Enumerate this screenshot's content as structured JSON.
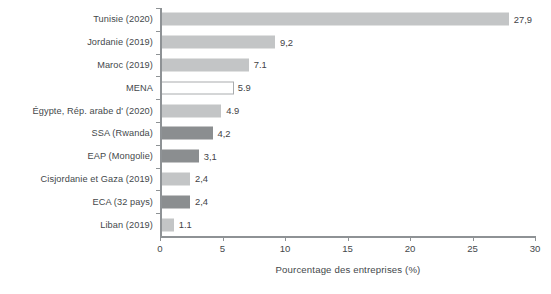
{
  "chart_data": {
    "type": "bar",
    "orientation": "horizontal",
    "title": "",
    "xlabel": "Pourcentage des entreprises (%)",
    "ylabel": "",
    "xlim": [
      0,
      30
    ],
    "xticks": [
      "0",
      "5",
      "10",
      "15",
      "20",
      "25",
      "30"
    ],
    "xtick_values": [
      0,
      5,
      10,
      15,
      20,
      25,
      30
    ],
    "grid": false,
    "legend": "none",
    "decimal_separator": ",",
    "categories": [
      "Tunisie (2020)",
      "Jordanie (2019)",
      "Maroc (2019)",
      "MENA",
      "Égypte, Rép. arabe d' (2020)",
      "SSA (Rwanda)",
      "EAP (Mongolie)",
      "Cisjordanie et Gaza (2019)",
      "ECA (32 pays)",
      "Liban (2019)"
    ],
    "values": [
      27.9,
      9.2,
      7.1,
      5.9,
      4.9,
      4.2,
      3.1,
      2.4,
      2.4,
      1.1
    ],
    "value_labels": [
      "27,9",
      "9,2",
      "7.1",
      "5.9",
      "4.9",
      "4,2",
      "3,1",
      "2,4",
      "2,4",
      "1.1"
    ],
    "bar_styles": [
      "light",
      "light",
      "light",
      "hollow",
      "light",
      "dark",
      "dark",
      "light",
      "dark",
      "light"
    ],
    "colors": {
      "light": "#c3c5c6",
      "dark": "#8b8e90",
      "hollow_fill": "#ffffff",
      "hollow_border": "#a9acae",
      "axis": "#8e9295",
      "text": "#44484b"
    }
  }
}
